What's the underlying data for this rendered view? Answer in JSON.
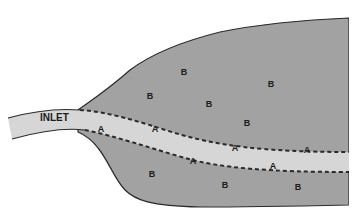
{
  "diagram": {
    "type": "estuary-zones",
    "colors": {
      "background": "#ffffff",
      "zone_b_fill": "#a2a2a2",
      "channel_fill": "#d6d6d6",
      "outline": "#2a2a2a",
      "dash": "#2a2a2a",
      "text": "#1c1c1c"
    },
    "inlet_label": {
      "text": "INLET",
      "x": 57,
      "y": 117
    },
    "zone_a_labels": [
      {
        "text": "A",
        "x": 101,
        "y": 132
      },
      {
        "text": "A",
        "x": 155,
        "y": 132
      },
      {
        "text": "A",
        "x": 193,
        "y": 164
      },
      {
        "text": "A",
        "x": 235,
        "y": 151
      },
      {
        "text": "A",
        "x": 273,
        "y": 169
      },
      {
        "text": "A",
        "x": 307,
        "y": 153
      }
    ],
    "zone_b_labels": [
      {
        "text": "B",
        "x": 184,
        "y": 75
      },
      {
        "text": "B",
        "x": 150,
        "y": 99
      },
      {
        "text": "B",
        "x": 209,
        "y": 107
      },
      {
        "text": "B",
        "x": 271,
        "y": 87
      },
      {
        "text": "B",
        "x": 247,
        "y": 126
      },
      {
        "text": "B",
        "x": 152,
        "y": 177
      },
      {
        "text": "B",
        "x": 225,
        "y": 188
      },
      {
        "text": "B",
        "x": 298,
        "y": 190
      }
    ]
  }
}
